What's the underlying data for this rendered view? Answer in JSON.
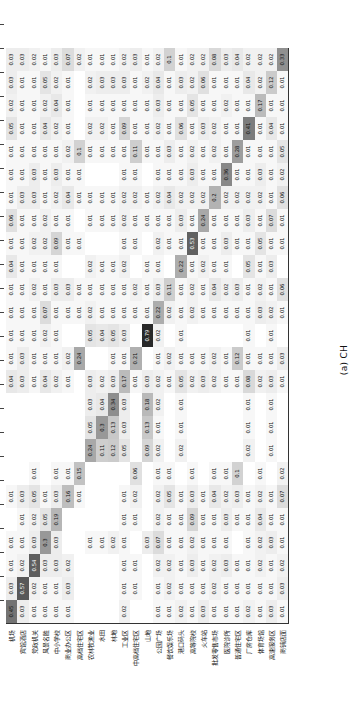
{
  "figure": {
    "caption": "(a) CH",
    "type": "confusion-matrix-heatmap"
  },
  "chart_data": {
    "type": "heatmap",
    "title": "",
    "subtitle": "(a) CH",
    "xlabel": "",
    "ylabel": "",
    "colormap": "greys",
    "value_range": [
      0,
      1
    ],
    "grid": false,
    "legend": "none",
    "note": "Row-normalised confusion matrix; blank cells are 0.00 and are not printed.",
    "categories": [
      "机场",
      "宾馆酒店",
      "党政机关",
      "风景名胜",
      "中小学校",
      "商业办公区",
      "高档住宅区",
      "农林牧渔业",
      "水田",
      "林地",
      "工业区",
      "中高档住宅区",
      "山地",
      "公园广场",
      "餐饮娱乐场",
      "港口码头",
      "高等院校",
      "火车站",
      "批发零售市场",
      "医院诊所",
      "普通住宅区",
      "厂房仓库",
      "体育场馆",
      "高速服务区",
      "商铺店面"
    ],
    "x_categories": [
      "机场",
      "宾馆酒店",
      "党政机关",
      "风景名胜",
      "中小学校",
      "商业办公区",
      "高档住宅区",
      "农林牧渔业",
      "水田",
      "林地",
      "工业区",
      "中高档住宅区",
      "山地",
      "公园广场",
      "餐饮娱乐场",
      "港口码头",
      "高等院校",
      "火车站",
      "批发零售市场",
      "医院诊所",
      "普通住宅区",
      "厂房仓库",
      "体育场馆",
      "高速服务区",
      "商铺店面"
    ],
    "y_categories": [
      "机场",
      "宾馆酒店",
      "党政机关",
      "风景名胜",
      "中小学校",
      "商业办公区",
      "高档住宅区",
      "农林牧渔业",
      "水田",
      "林地",
      "工业区",
      "中高档住宅区",
      "山地",
      "公园广场",
      "餐饮娱乐场",
      "港口码头",
      "高等院校",
      "火车站",
      "批发零售市场",
      "医院诊所",
      "普通住宅区",
      "厂房仓库",
      "体育场馆",
      "高速服务区",
      "商铺店面"
    ],
    "values": [
      [
        0.45,
        0.03,
        0.01,
        0.01,
        0.0,
        0.01,
        0.0,
        0.0,
        0.0,
        0.0,
        0.04,
        0.01,
        0.01,
        0.01,
        0.01,
        0.04,
        0.01,
        0.06,
        0.01,
        0.01,
        0.01,
        0.05,
        0.02,
        0.03,
        0.03
      ],
      [
        0.03,
        0.57,
        0.02,
        0.01,
        0.01,
        0.03,
        0.0,
        0.0,
        0.0,
        0.0,
        0.03,
        0.03,
        0.01,
        0.01,
        0.01,
        0.01,
        0.01,
        0.01,
        0.03,
        0.01,
        0.01,
        0.01,
        0.01,
        0.01,
        0.03
      ],
      [
        0.01,
        0.02,
        0.54,
        0.03,
        0.02,
        0.05,
        0.01,
        0.0,
        0.0,
        0.0,
        0.01,
        0.01,
        0.01,
        0.01,
        0.02,
        0.01,
        0.02,
        0.01,
        0.03,
        0.03,
        0.01,
        0.01,
        0.01,
        0.01,
        0.02
      ],
      [
        0.01,
        0.01,
        0.03,
        0.3,
        0.05,
        0.01,
        0.0,
        0.0,
        0.0,
        0.0,
        0.04,
        0.01,
        0.02,
        0.07,
        0.01,
        0.01,
        0.02,
        0.02,
        0.01,
        0.01,
        0.01,
        0.04,
        0.02,
        0.05,
        0.01
      ],
      [
        0.01,
        0.01,
        0.03,
        0.03,
        0.19,
        0.03,
        0.01,
        0.0,
        0.0,
        0.0,
        0.02,
        0.01,
        0.01,
        0.01,
        0.03,
        0.01,
        0.09,
        0.01,
        0.02,
        0.03,
        0.01,
        0.02,
        0.04,
        0.02,
        0.03
      ],
      [
        0.01,
        0.03,
        0.02,
        0.0,
        0.0,
        0.16,
        0.01,
        0.0,
        0.0,
        0.0,
        0.01,
        0.02,
        0.0,
        0.01,
        0.03,
        0.0,
        0.01,
        0.01,
        0.04,
        0.01,
        0.02,
        0.01,
        0.01,
        0.01,
        0.07
      ],
      [
        0.0,
        0.0,
        0.0,
        0.0,
        0.0,
        0.01,
        0.15,
        0.0,
        0.0,
        0.0,
        0.0,
        0.24,
        0.0,
        0.01,
        0.01,
        0.0,
        0.01,
        0.0,
        0.01,
        0.01,
        0.1,
        0.0,
        0.0,
        0.0,
        0.02
      ],
      [
        0.0,
        0.0,
        0.0,
        0.01,
        0.0,
        0.0,
        0.0,
        0.24,
        0.05,
        0.03,
        0.03,
        0.0,
        0.05,
        0.02,
        0.01,
        0.02,
        0.0,
        0.01,
        0.01,
        0.0,
        0.01,
        0.02,
        0.01,
        0.02,
        0.01
      ],
      [
        0.0,
        0.0,
        0.0,
        0.01,
        0.0,
        0.0,
        0.0,
        0.11,
        0.3,
        0.04,
        0.02,
        0.0,
        0.04,
        0.01,
        0.01,
        0.01,
        0.0,
        0.01,
        0.01,
        0.0,
        0.01,
        0.02,
        0.01,
        0.03,
        0.01
      ],
      [
        0.0,
        0.0,
        0.0,
        0.02,
        0.0,
        0.0,
        0.0,
        0.12,
        0.13,
        0.34,
        0.03,
        0.01,
        0.05,
        0.01,
        0.01,
        0.01,
        0.0,
        0.01,
        0.01,
        0.0,
        0.01,
        0.01,
        0.01,
        0.03,
        0.01
      ],
      [
        0.02,
        0.01,
        0.01,
        0.01,
        0.01,
        0.01,
        0.0,
        0.05,
        0.03,
        0.03,
        0.17,
        0.01,
        0.03,
        0.01,
        0.01,
        0.02,
        0.01,
        0.02,
        0.02,
        0.01,
        0.01,
        0.09,
        0.01,
        0.03,
        0.02
      ],
      [
        0.0,
        0.01,
        0.01,
        0.0,
        0.01,
        0.02,
        0.06,
        0.0,
        0.0,
        0.0,
        0.01,
        0.21,
        0.0,
        0.01,
        0.02,
        0.0,
        0.01,
        0.01,
        0.02,
        0.01,
        0.11,
        0.01,
        0.01,
        0.01,
        0.03
      ],
      [
        0.0,
        0.0,
        0.0,
        0.03,
        0.0,
        0.0,
        0.0,
        0.09,
        0.13,
        0.18,
        0.03,
        0.0,
        0.79,
        0.01,
        0.01,
        0.01,
        0.0,
        0.01,
        0.01,
        0.0,
        0.01,
        0.01,
        0.01,
        0.02,
        0.01
      ],
      [
        0.01,
        0.01,
        0.02,
        0.07,
        0.02,
        0.02,
        0.01,
        0.02,
        0.01,
        0.02,
        0.02,
        0.01,
        0.02,
        0.22,
        0.03,
        0.01,
        0.02,
        0.01,
        0.02,
        0.01,
        0.01,
        0.02,
        0.03,
        0.04,
        0.02
      ],
      [
        0.01,
        0.02,
        0.02,
        0.01,
        0.01,
        0.05,
        0.01,
        0.0,
        0.0,
        0.0,
        0.01,
        0.02,
        0.0,
        0.02,
        0.11,
        0.0,
        0.01,
        0.01,
        0.04,
        0.01,
        0.03,
        0.01,
        0.01,
        0.01,
        0.1
      ],
      [
        0.02,
        0.01,
        0.01,
        0.01,
        0.01,
        0.01,
        0.0,
        0.02,
        0.01,
        0.01,
        0.05,
        0.01,
        0.01,
        0.01,
        0.01,
        0.22,
        0.01,
        0.03,
        0.02,
        0.01,
        0.01,
        0.06,
        0.01,
        0.03,
        0.01
      ],
      [
        0.01,
        0.01,
        0.03,
        0.02,
        0.09,
        0.03,
        0.01,
        0.0,
        0.0,
        0.0,
        0.02,
        0.01,
        0.0,
        0.02,
        0.02,
        0.01,
        0.53,
        0.01,
        0.02,
        0.03,
        0.02,
        0.01,
        0.05,
        0.02,
        0.02
      ],
      [
        0.03,
        0.01,
        0.01,
        0.01,
        0.01,
        0.01,
        0.0,
        0.0,
        0.0,
        0.0,
        0.03,
        0.01,
        0.0,
        0.01,
        0.01,
        0.02,
        0.01,
        0.24,
        0.02,
        0.01,
        0.01,
        0.03,
        0.01,
        0.06,
        0.02
      ],
      [
        0.01,
        0.02,
        0.02,
        0.01,
        0.01,
        0.04,
        0.01,
        0.0,
        0.0,
        0.0,
        0.02,
        0.02,
        0.0,
        0.01,
        0.04,
        0.01,
        0.01,
        0.01,
        0.2,
        0.01,
        0.02,
        0.02,
        0.01,
        0.01,
        0.08
      ],
      [
        0.01,
        0.01,
        0.03,
        0.01,
        0.03,
        0.02,
        0.01,
        0.0,
        0.0,
        0.0,
        0.01,
        0.01,
        0.0,
        0.01,
        0.02,
        0.01,
        0.03,
        0.01,
        0.02,
        0.36,
        0.01,
        0.01,
        0.02,
        0.01,
        0.03
      ],
      [
        0.01,
        0.01,
        0.01,
        0.0,
        0.01,
        0.03,
        0.1,
        0.0,
        0.0,
        0.0,
        0.01,
        0.12,
        0.0,
        0.01,
        0.03,
        0.0,
        0.01,
        0.01,
        0.02,
        0.01,
        0.28,
        0.01,
        0.01,
        0.01,
        0.04
      ],
      [
        0.02,
        0.01,
        0.01,
        0.01,
        0.01,
        0.01,
        0.0,
        0.02,
        0.01,
        0.01,
        0.08,
        0.01,
        0.01,
        0.01,
        0.01,
        0.05,
        0.01,
        0.03,
        0.02,
        0.01,
        0.01,
        0.41,
        0.01,
        0.04,
        0.02
      ],
      [
        0.01,
        0.01,
        0.02,
        0.02,
        0.04,
        0.02,
        0.01,
        0.0,
        0.0,
        0.0,
        0.02,
        0.01,
        0.0,
        0.03,
        0.02,
        0.01,
        0.05,
        0.01,
        0.02,
        0.03,
        0.01,
        0.01,
        0.17,
        0.02,
        0.02
      ],
      [
        0.03,
        0.01,
        0.01,
        0.03,
        0.01,
        0.01,
        0.0,
        0.01,
        0.01,
        0.01,
        0.03,
        0.01,
        0.01,
        0.02,
        0.01,
        0.03,
        0.01,
        0.07,
        0.01,
        0.01,
        0.01,
        0.04,
        0.01,
        0.12,
        0.02
      ],
      [
        0.01,
        0.03,
        0.02,
        0.01,
        0.01,
        0.07,
        0.02,
        0.0,
        0.0,
        0.0,
        0.01,
        0.03,
        0.0,
        0.01,
        0.06,
        0.0,
        0.01,
        0.01,
        0.06,
        0.02,
        0.05,
        0.01,
        0.01,
        0.01,
        0.33
      ]
    ]
  }
}
